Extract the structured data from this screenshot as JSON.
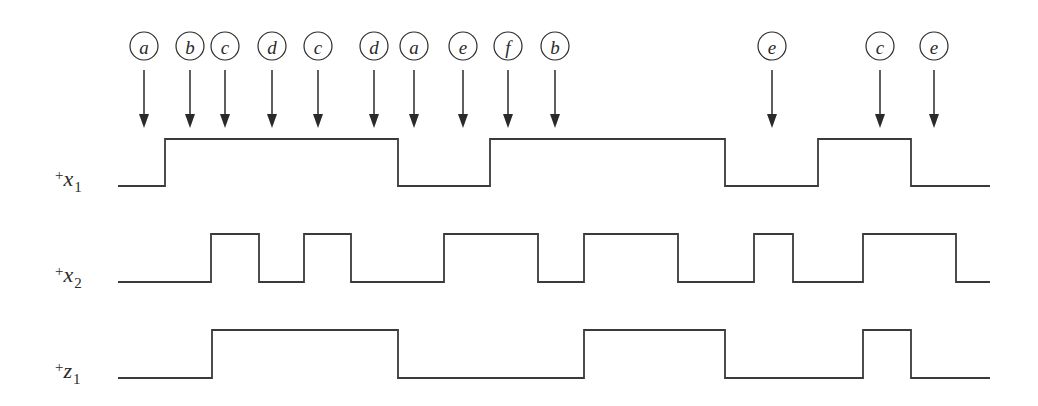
{
  "diagram": {
    "type": "timing-diagram",
    "events": [
      {
        "label": "a",
        "x": 144
      },
      {
        "label": "b",
        "x": 190
      },
      {
        "label": "c",
        "x": 225
      },
      {
        "label": "d",
        "x": 272
      },
      {
        "label": "c",
        "x": 318
      },
      {
        "label": "d",
        "x": 374
      },
      {
        "label": "a",
        "x": 414
      },
      {
        "label": "e",
        "x": 463
      },
      {
        "label": "f",
        "x": 508
      },
      {
        "label": "b",
        "x": 555
      },
      {
        "label": "e",
        "x": 772
      },
      {
        "label": "c",
        "x": 880
      },
      {
        "label": "e",
        "x": 934
      }
    ],
    "signals": [
      {
        "name": "x1",
        "prefix": "+",
        "variable": "x",
        "subscript": "1",
        "label_y": 186,
        "low_y": 186,
        "high_y": 139,
        "start_x": 118,
        "end_x": 990,
        "initial": 0,
        "transitions": [
          165,
          398,
          490,
          725,
          818,
          911
        ]
      },
      {
        "name": "x2",
        "prefix": "+",
        "variable": "x",
        "subscript": "2",
        "label_y": 282,
        "low_y": 282,
        "high_y": 234,
        "start_x": 118,
        "end_x": 990,
        "initial": 0,
        "transitions": [
          211,
          259,
          304,
          351,
          444,
          538,
          584,
          678,
          754,
          793,
          863,
          956
        ]
      },
      {
        "name": "z1",
        "prefix": "+",
        "variable": "z",
        "subscript": "1",
        "label_y": 378,
        "low_y": 378,
        "high_y": 330,
        "start_x": 118,
        "end_x": 990,
        "initial": 0,
        "transitions": [
          212,
          398,
          584,
          725,
          863,
          911
        ]
      }
    ],
    "style": {
      "line_color": "#3a3a3a",
      "text_color": "#2a2a2a",
      "background": "#ffffff"
    }
  }
}
